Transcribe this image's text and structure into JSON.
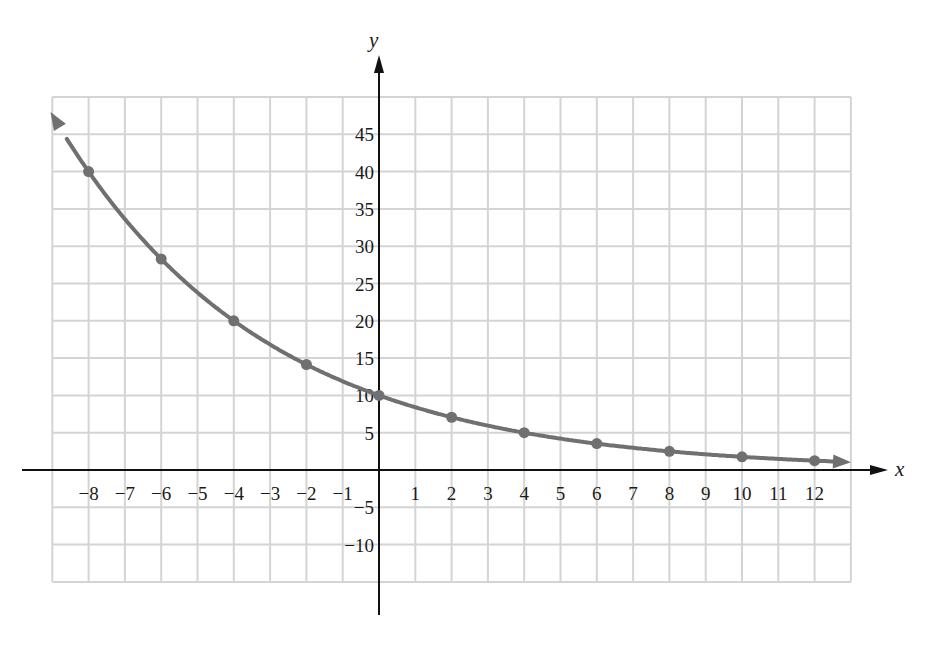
{
  "chart_data": {
    "type": "line",
    "title": "",
    "function": "y = 10 * 2^(-x/4)",
    "xlabel": "x",
    "ylabel": "y",
    "xlim": [
      -9,
      13
    ],
    "ylim": [
      -15,
      50
    ],
    "grid": true,
    "legend": null,
    "x_ticks": [
      "−8",
      "−7",
      "−6",
      "−5",
      "−4",
      "−3",
      "−2",
      "−1",
      "1",
      "2",
      "3",
      "4",
      "5",
      "6",
      "7",
      "8",
      "9",
      "10",
      "11",
      "12"
    ],
    "x_tick_values": [
      -8,
      -7,
      -6,
      -5,
      -4,
      -3,
      -2,
      -1,
      1,
      2,
      3,
      4,
      5,
      6,
      7,
      8,
      9,
      10,
      11,
      12
    ],
    "y_ticks": [
      "45",
      "40",
      "35",
      "30",
      "25",
      "20",
      "15",
      "10",
      "5",
      "−5",
      "−10"
    ],
    "y_tick_values": [
      45,
      40,
      35,
      30,
      25,
      20,
      15,
      10,
      5,
      -5,
      -10
    ],
    "series": [
      {
        "name": "curve",
        "x": [
          -8,
          -6,
          -4,
          -2,
          0,
          2,
          4,
          6,
          8,
          10,
          12
        ],
        "values": [
          40,
          28.3,
          20,
          14.1,
          10,
          7.1,
          5,
          3.5,
          2.5,
          1.8,
          1.25
        ]
      }
    ],
    "colors": {
      "curve": "#707070",
      "grid": "#d4d4d4",
      "axis": "#111111"
    }
  }
}
